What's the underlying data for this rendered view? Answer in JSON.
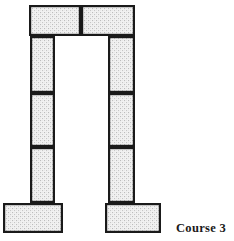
{
  "figure": {
    "label": "Course 3",
    "label_position": {
      "x": 176,
      "y": 222
    },
    "canvas": {
      "width": 234,
      "height": 241
    },
    "colors": {
      "stroke": "#1a1a1a",
      "fill": "#f0f0f0",
      "stipple_dot": "#b8b8b8",
      "background": "#ffffff",
      "text": "#1a1a1a"
    },
    "stroke_width": 2.2
  },
  "structure": {
    "type": "post-and-lintel",
    "description": "Two masonry piers supporting a two-block lintel, each pier resting on a spread footing",
    "blocks": [
      {
        "id": "lintel-left",
        "name": "lintel-block-left",
        "group": "lintel",
        "x": 29,
        "y": 5,
        "width": 52,
        "height": 31
      },
      {
        "id": "lintel-right",
        "name": "lintel-block-right",
        "group": "lintel",
        "x": 81,
        "y": 5,
        "width": 54,
        "height": 31
      },
      {
        "id": "left-pier-upper",
        "name": "left-pier-block-upper",
        "group": "left-pier",
        "x": 30,
        "y": 36,
        "width": 25,
        "height": 57
      },
      {
        "id": "left-pier-middle",
        "name": "left-pier-block-middle",
        "group": "left-pier",
        "x": 30,
        "y": 93,
        "width": 25,
        "height": 54
      },
      {
        "id": "left-pier-lower",
        "name": "left-pier-block-lower",
        "group": "left-pier",
        "x": 30,
        "y": 147,
        "width": 25,
        "height": 56
      },
      {
        "id": "right-pier-upper",
        "name": "right-pier-block-upper",
        "group": "right-pier",
        "x": 108,
        "y": 36,
        "width": 27,
        "height": 57
      },
      {
        "id": "right-pier-middle",
        "name": "right-pier-block-middle",
        "group": "right-pier",
        "x": 108,
        "y": 93,
        "width": 27,
        "height": 54
      },
      {
        "id": "right-pier-lower",
        "name": "right-pier-block-lower",
        "group": "right-pier",
        "x": 108,
        "y": 147,
        "width": 27,
        "height": 56
      },
      {
        "id": "left-footing",
        "name": "left-footing-block",
        "group": "footing",
        "x": 3,
        "y": 203,
        "width": 60,
        "height": 30
      },
      {
        "id": "right-footing",
        "name": "right-footing-block",
        "group": "footing",
        "x": 105,
        "y": 203,
        "width": 56,
        "height": 30
      }
    ],
    "opening": {
      "name": "doorway-opening",
      "x": 55,
      "y": 36,
      "width": 53,
      "height": 167
    }
  }
}
